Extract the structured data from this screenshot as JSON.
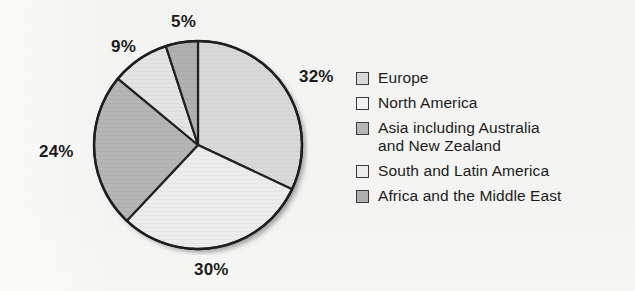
{
  "background_color": "#f4f4f2",
  "chart_data": {
    "type": "pie",
    "title": "",
    "xlabel": "",
    "ylabel": "",
    "unit": "%",
    "start_angle_deg": 0,
    "direction": "clockwise",
    "legend_position": "right",
    "grid": false,
    "categories": [
      "Europe",
      "North America",
      "Asia including Australia and New Zealand",
      "South and Latin America",
      "Africa and the Middle East"
    ],
    "values": [
      32,
      9,
      24,
      30,
      5
    ],
    "slices": [
      {
        "label": "Europe",
        "value": 32,
        "value_label": "32%",
        "color": "#d9d9d9",
        "order_clockwise": 1
      },
      {
        "label": "South and Latin America",
        "value": 30,
        "value_label": "30%",
        "color": "#ececec",
        "order_clockwise": 2
      },
      {
        "label": "Asia including Australia and New Zealand",
        "value": 24,
        "value_label": "24%",
        "color": "#b5b5b5",
        "order_clockwise": 3
      },
      {
        "label": "North America",
        "value": 9,
        "value_label": "9%",
        "color": "#e4e4e4",
        "order_clockwise": 4
      },
      {
        "label": "Africa and the Middle East",
        "value": 5,
        "value_label": "5%",
        "color": "#b0b0b0",
        "order_clockwise": 5
      }
    ]
  },
  "pie_labels": {
    "europe": "32%",
    "south_latin_america": "30%",
    "asia": "24%",
    "north_america": "9%",
    "africa_middle_east": "5%"
  },
  "legend": {
    "items": [
      {
        "label": "Europe",
        "label_line2": "",
        "swatch_color": "#d9d9d9"
      },
      {
        "label": "North America",
        "label_line2": "",
        "swatch_color": "#f2f2f2"
      },
      {
        "label": "Asia including Australia",
        "label_line2": "and New Zealand",
        "swatch_color": "#b5b5b5"
      },
      {
        "label": "South and Latin America",
        "label_line2": "",
        "swatch_color": "#ececec"
      },
      {
        "label": "Africa and the Middle East",
        "label_line2": "",
        "swatch_color": "#b0b0b0"
      }
    ]
  }
}
